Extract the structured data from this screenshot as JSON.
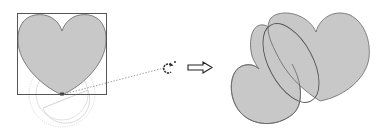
{
  "diagram": {
    "description": "Rotating a heart shape about its bottom handle; result shows the rotated heart overlapping an ellipse",
    "colors": {
      "shape_fill": "#c8c8c8",
      "shape_stroke": "#555555",
      "bbox_stroke": "#555555",
      "guide_stroke": "#c8c8c8",
      "dotted_line": "#777777",
      "arrow_stroke": "#222222"
    },
    "left_panel": {
      "shape": "heart",
      "bounding_box": "selection-box",
      "rotation_guide": "protractor-circle",
      "pivot": "bottom-center-handle"
    },
    "rotate_cursor": {
      "icon": "rotate-icon",
      "marker": "star-dot"
    },
    "transition_arrow": {
      "icon": "right-arrow-icon"
    },
    "right_panel": {
      "shapes": [
        "rotated-heart",
        "ellipse"
      ]
    }
  }
}
